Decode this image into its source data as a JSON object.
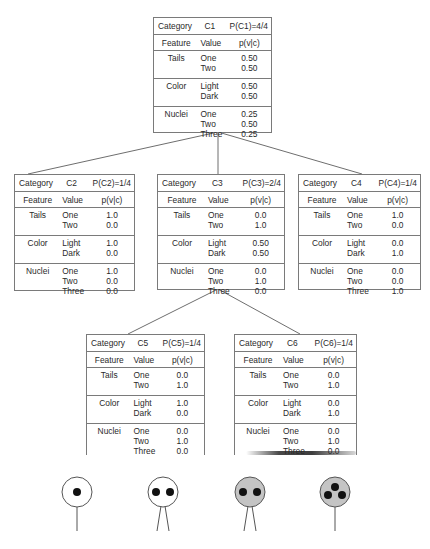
{
  "column_headers": {
    "category": "Category",
    "feature": "Feature",
    "value": "Value",
    "prob": "p(v|c)"
  },
  "nodes": {
    "c1": {
      "name": "C1",
      "prior": "P(C1)=4/4",
      "features": [
        {
          "name": "Tails",
          "values": [
            "One",
            "Two"
          ],
          "probs": [
            "0.50",
            "0.50"
          ]
        },
        {
          "name": "Color",
          "values": [
            "Light",
            "Dark"
          ],
          "probs": [
            "0.50",
            "0.50"
          ]
        },
        {
          "name": "Nuclei",
          "values": [
            "One",
            "Two",
            "Three"
          ],
          "probs": [
            "0.25",
            "0.50",
            "0.25"
          ]
        }
      ]
    },
    "c2": {
      "name": "C2",
      "prior": "P(C2)=1/4",
      "features": [
        {
          "name": "Tails",
          "values": [
            "One",
            "Two"
          ],
          "probs": [
            "1.0",
            "0.0"
          ]
        },
        {
          "name": "Color",
          "values": [
            "Light",
            "Dark"
          ],
          "probs": [
            "1.0",
            "0.0"
          ]
        },
        {
          "name": "Nuclei",
          "values": [
            "One",
            "Two",
            "Three"
          ],
          "probs": [
            "1.0",
            "0.0",
            "0.0"
          ]
        }
      ]
    },
    "c3": {
      "name": "C3",
      "prior": "P(C3)=2/4",
      "features": [
        {
          "name": "Tails",
          "values": [
            "One",
            "Two"
          ],
          "probs": [
            "0.0",
            "1.0"
          ]
        },
        {
          "name": "Color",
          "values": [
            "Light",
            "Dark"
          ],
          "probs": [
            "0.50",
            "0.50"
          ]
        },
        {
          "name": "Nuclei",
          "values": [
            "One",
            "Two",
            "Three"
          ],
          "probs": [
            "0.0",
            "1.0",
            "0.0"
          ]
        }
      ]
    },
    "c4": {
      "name": "C4",
      "prior": "P(C4)=1/4",
      "features": [
        {
          "name": "Tails",
          "values": [
            "One",
            "Two"
          ],
          "probs": [
            "1.0",
            "0.0"
          ]
        },
        {
          "name": "Color",
          "values": [
            "Light",
            "Dark"
          ],
          "probs": [
            "0.0",
            "1.0"
          ]
        },
        {
          "name": "Nuclei",
          "values": [
            "One",
            "Two",
            "Three"
          ],
          "probs": [
            "0.0",
            "0.0",
            "1.0"
          ]
        }
      ]
    },
    "c5": {
      "name": "C5",
      "prior": "P(C5)=1/4",
      "features": [
        {
          "name": "Tails",
          "values": [
            "One",
            "Two"
          ],
          "probs": [
            "0.0",
            "1.0"
          ]
        },
        {
          "name": "Color",
          "values": [
            "Light",
            "Dark"
          ],
          "probs": [
            "1.0",
            "0.0"
          ]
        },
        {
          "name": "Nuclei",
          "values": [
            "One",
            "Two",
            "Three"
          ],
          "probs": [
            "0.0",
            "1.0",
            "0.0"
          ]
        }
      ]
    },
    "c6": {
      "name": "C6",
      "prior": "P(C6)=1/4",
      "features": [
        {
          "name": "Tails",
          "values": [
            "One",
            "Two"
          ],
          "probs": [
            "0.0",
            "1.0"
          ]
        },
        {
          "name": "Color",
          "values": [
            "Light",
            "Dark"
          ],
          "probs": [
            "0.0",
            "1.0"
          ]
        },
        {
          "name": "Nuclei",
          "values": [
            "One",
            "Two",
            "Three"
          ],
          "probs": [
            "0.0",
            "1.0",
            "0.0"
          ]
        }
      ]
    }
  },
  "cells": [
    {
      "color": "light",
      "nuclei": 1,
      "tails": 1
    },
    {
      "color": "light",
      "nuclei": 2,
      "tails": 2
    },
    {
      "color": "dark",
      "nuclei": 2,
      "tails": 2
    },
    {
      "color": "dark",
      "nuclei": 3,
      "tails": 1
    }
  ],
  "colors": {
    "line": "#7a7a7a",
    "text": "#2a2a2a",
    "cell_light": "#ffffff",
    "cell_dark": "#c4c4c4",
    "nucleus": "#111111"
  }
}
